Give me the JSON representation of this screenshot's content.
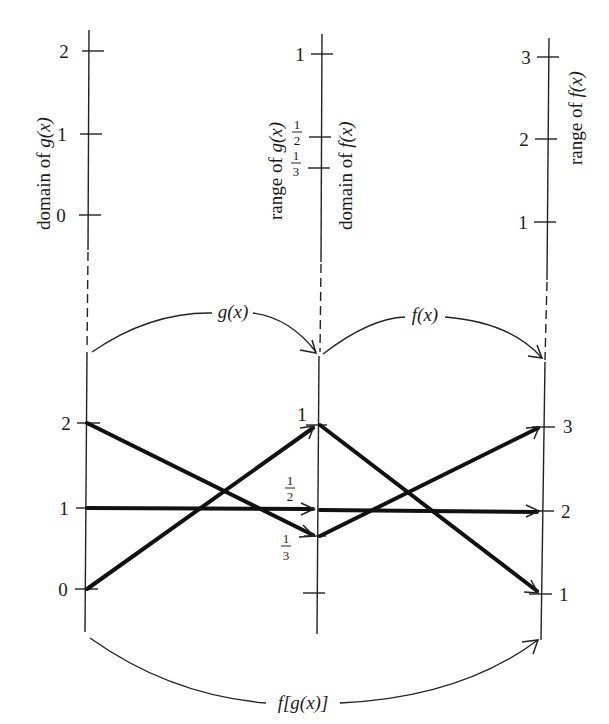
{
  "figure": {
    "axes_top": [
      {
        "id": "domain-g",
        "label": "domain of g(x)",
        "ticks": [
          "2",
          "1",
          "0"
        ]
      },
      {
        "id": "range-g-domain-f",
        "label_left": "range of g(x)",
        "label_right": "domain of f(x)",
        "ticks": [
          "1",
          "1/2",
          "1/3"
        ]
      },
      {
        "id": "range-f",
        "label": "range of f(x)",
        "ticks": [
          "3",
          "2",
          "1"
        ]
      }
    ],
    "arcs": {
      "g": "g(x)",
      "f": "f(x)",
      "composite": "f[g(x)]"
    },
    "bottom_ticks": {
      "left": [
        "2",
        "1",
        "0"
      ],
      "middle": {
        "one": "1",
        "half_num": "1",
        "half_den": "2",
        "third_num": "1",
        "third_den": "3"
      },
      "right": [
        "3",
        "2",
        "1"
      ]
    },
    "mappings_g": [
      {
        "from": "0",
        "to": "1"
      },
      {
        "from": "1",
        "to": "1/2"
      },
      {
        "from": "2",
        "to": "1/3"
      }
    ],
    "mappings_f": [
      {
        "from": "1",
        "to": "1"
      },
      {
        "from": "1/2",
        "to": "2"
      },
      {
        "from": "1/3",
        "to": "3"
      }
    ],
    "labels": {
      "domain_g": "domain of ",
      "range_g": "range of ",
      "domain_f": "domain of ",
      "range_f": "range of ",
      "g_of_x": "g(x)",
      "f_of_x": "f(x)"
    }
  }
}
